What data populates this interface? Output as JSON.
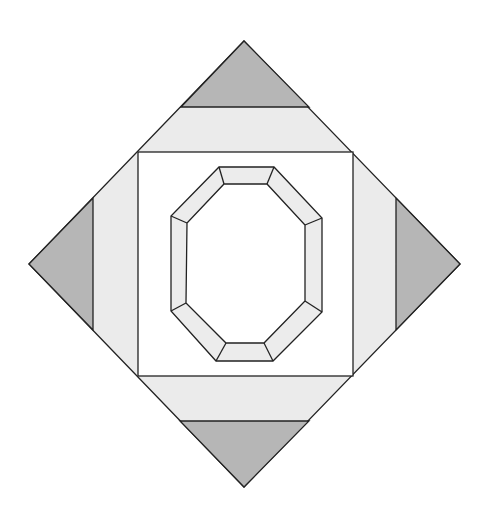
{
  "diagram": {
    "title": "",
    "type": "quilt-block",
    "canvas": {
      "width": 491,
      "height": 518
    },
    "colors": {
      "background": "#ffffff",
      "corner_triangle": "#b6b6b6",
      "band": "#ebebeb",
      "inner_square": "#ffffff",
      "octagon_frame": "#ececec",
      "octagon_center": "#ffffff",
      "outline": "#222222"
    },
    "diamond": {
      "top": [
        244,
        41
      ],
      "right": [
        460,
        264
      ],
      "bottom": [
        244,
        487
      ],
      "left": [
        29,
        264
      ]
    },
    "inner_square": {
      "x1": 138,
      "y1": 152,
      "x2": 353,
      "y2": 376
    },
    "corner_triangles": [
      {
        "name": "top",
        "points": [
          [
            244,
            41
          ],
          [
            309,
            107
          ],
          [
            181,
            107
          ]
        ]
      },
      {
        "name": "right",
        "points": [
          [
            460,
            264
          ],
          [
            396,
            330
          ],
          [
            396,
            198
          ]
        ]
      },
      {
        "name": "bottom",
        "points": [
          [
            244,
            487
          ],
          [
            180,
            421
          ],
          [
            309,
            421
          ]
        ]
      },
      {
        "name": "left",
        "points": [
          [
            29,
            264
          ],
          [
            93,
            198
          ],
          [
            93,
            330
          ]
        ]
      }
    ],
    "octagon": {
      "outer": [
        [
          219,
          167
        ],
        [
          274,
          167
        ],
        [
          322,
          218
        ],
        [
          322,
          312
        ],
        [
          273,
          361
        ],
        [
          216,
          361
        ],
        [
          171,
          311
        ],
        [
          171,
          216
        ]
      ],
      "inner": [
        [
          224,
          184
        ],
        [
          267,
          184
        ],
        [
          305,
          225
        ],
        [
          305,
          301
        ],
        [
          264,
          343
        ],
        [
          226,
          343
        ],
        [
          186,
          303
        ],
        [
          187,
          223
        ]
      ]
    }
  }
}
